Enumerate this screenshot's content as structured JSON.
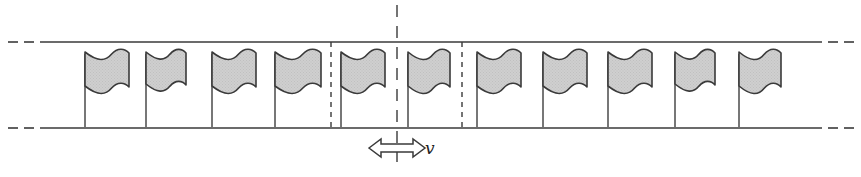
{
  "figure": {
    "type": "physics-schematic",
    "width": 861,
    "height": 177,
    "background_color": "#ffffff"
  },
  "colors": {
    "line": "#3a3a3a",
    "flag_fill": "#cbcbcb",
    "flag_stroke": "#3a3a3a",
    "pole": "#4a4a4a",
    "dash": "#3a3a3a",
    "text": "#222222",
    "background": "#ffffff"
  },
  "rails": {
    "name": "channel-walls",
    "top_y": 42,
    "bottom_y": 128,
    "solid_x_start": 40,
    "solid_x_end": 822,
    "stroke_width": 1.6,
    "lead_dashes_left": [
      {
        "x1": 8,
        "x2": 18
      },
      {
        "x1": 24,
        "x2": 34
      }
    ],
    "lead_dashes_right": [
      {
        "x1": 828,
        "x2": 838
      },
      {
        "x1": 844,
        "x2": 854
      }
    ]
  },
  "cell_boundaries": [
    {
      "name": "cell-boundary-left",
      "x": 331,
      "y_top": 42,
      "y_bottom": 130,
      "dash": "5,5"
    },
    {
      "name": "cell-boundary-right",
      "x": 462,
      "y_top": 42,
      "y_bottom": 130,
      "dash": "5,5"
    }
  ],
  "center_axis": {
    "name": "center-axis",
    "x": 397,
    "y_top": 5,
    "y_bottom": 162,
    "dash": "12,9",
    "stroke_width": 1.4
  },
  "velocity_arrow": {
    "name": "velocity-arrow",
    "label": "v",
    "label_x": 425,
    "label_y": 140,
    "center_x": 397,
    "y": 148,
    "half_length": 28,
    "head_length": 12,
    "head_half_height": 9,
    "shaft_half_height": 4,
    "fill": "#ffffff",
    "stroke": "#3a3a3a"
  },
  "flags": {
    "count": 11,
    "pole_bottom_y": 127,
    "banner_top_y": 52,
    "items": [
      {
        "id": "flag-1",
        "pole_x": 85,
        "banner_width": 44,
        "banner_height": 34
      },
      {
        "id": "flag-2",
        "pole_x": 146,
        "banner_width": 40,
        "banner_height": 32
      },
      {
        "id": "flag-3",
        "pole_x": 212,
        "banner_width": 44,
        "banner_height": 34
      },
      {
        "id": "flag-4",
        "pole_x": 275,
        "banner_width": 46,
        "banner_height": 34
      },
      {
        "id": "flag-5",
        "pole_x": 341,
        "banner_width": 44,
        "banner_height": 34
      },
      {
        "id": "flag-6",
        "pole_x": 408,
        "banner_width": 42,
        "banner_height": 34
      },
      {
        "id": "flag-7",
        "pole_x": 477,
        "banner_width": 44,
        "banner_height": 34
      },
      {
        "id": "flag-8",
        "pole_x": 543,
        "banner_width": 44,
        "banner_height": 34
      },
      {
        "id": "flag-9",
        "pole_x": 608,
        "banner_width": 44,
        "banner_height": 34
      },
      {
        "id": "flag-10",
        "pole_x": 675,
        "banner_width": 40,
        "banner_height": 32
      },
      {
        "id": "flag-11",
        "pole_x": 739,
        "banner_width": 42,
        "banner_height": 34
      }
    ]
  }
}
